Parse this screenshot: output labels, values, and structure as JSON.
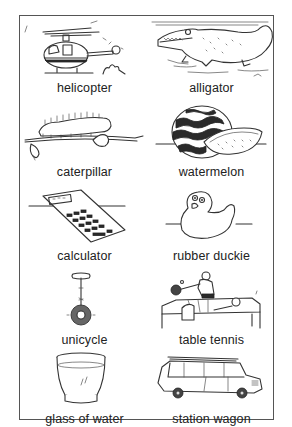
{
  "worksheet": {
    "items": [
      {
        "label": "helicopter",
        "icon": "helicopter-icon"
      },
      {
        "label": "alligator",
        "icon": "alligator-icon"
      },
      {
        "label": "caterpillar",
        "icon": "caterpillar-icon"
      },
      {
        "label": "watermelon",
        "icon": "watermelon-icon"
      },
      {
        "label": "calculator",
        "icon": "calculator-icon"
      },
      {
        "label": "rubber duckie",
        "icon": "rubber-duckie-icon"
      },
      {
        "label": "unicycle",
        "icon": "unicycle-icon"
      },
      {
        "label": "table tennis",
        "icon": "table-tennis-icon"
      },
      {
        "label": "glass of water",
        "icon": "glass-of-water-icon"
      },
      {
        "label": "station wagon",
        "icon": "station-wagon-icon"
      }
    ],
    "colors": {
      "ink": "#333333",
      "border": "#555555",
      "background": "#ffffff"
    }
  }
}
